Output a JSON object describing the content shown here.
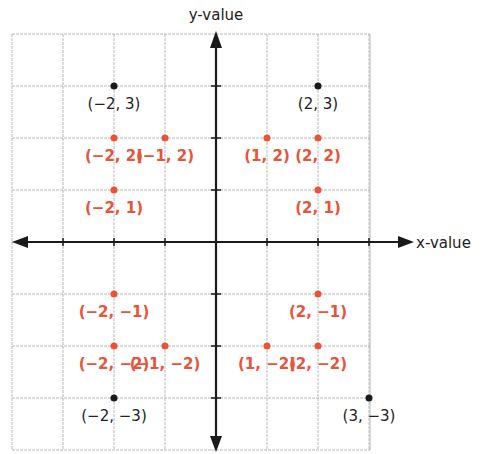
{
  "chart_data": {
    "type": "scatter",
    "title": "",
    "xlabel": "x-value",
    "ylabel": "y-value",
    "xlim": [
      -4,
      3
    ],
    "ylim": [
      -4,
      4
    ],
    "grid": true,
    "colors": {
      "red": "#e8533a",
      "black": "#1a1a1a",
      "grid": "#b8b8b8",
      "axis": "#1a1a1a"
    },
    "series": [
      {
        "name": "red points",
        "color": "#e8533a",
        "points": [
          {
            "x": -2,
            "y": 2,
            "label": "(−2, 2)"
          },
          {
            "x": -1,
            "y": 2,
            "label": "(−1, 2)"
          },
          {
            "x": 1,
            "y": 2,
            "label": "(1, 2)"
          },
          {
            "x": 2,
            "y": 2,
            "label": "(2, 2)"
          },
          {
            "x": -2,
            "y": 1,
            "label": "(−2, 1)"
          },
          {
            "x": 2,
            "y": 1,
            "label": "(2, 1)"
          },
          {
            "x": -2,
            "y": -1,
            "label": "(−2, −1)"
          },
          {
            "x": 2,
            "y": -1,
            "label": "(2, −1)"
          },
          {
            "x": -2,
            "y": -2,
            "label": "(−2, −2)"
          },
          {
            "x": -1,
            "y": -2,
            "label": "(−1, −2)"
          },
          {
            "x": 1,
            "y": -2,
            "label": "(1, −2)"
          },
          {
            "x": 2,
            "y": -2,
            "label": "(2, −2)"
          }
        ]
      },
      {
        "name": "black points",
        "color": "#1a1a1a",
        "points": [
          {
            "x": -2,
            "y": 3,
            "label": "(−2, 3)"
          },
          {
            "x": 2,
            "y": 3,
            "label": "(2, 3)"
          },
          {
            "x": -2,
            "y": -3,
            "label": "(−2, −3)"
          },
          {
            "x": 3,
            "y": -3,
            "label": "(3, −3)"
          }
        ]
      }
    ]
  },
  "axes": {
    "x_title": "x-value",
    "y_title": "y-value"
  }
}
